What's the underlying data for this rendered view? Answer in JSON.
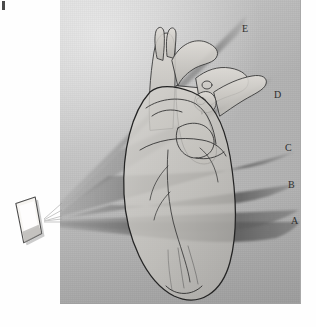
{
  "figure": {
    "panel": {
      "background_color": "#b9b9b9",
      "border_color": "#9a9a9a"
    },
    "page_background": "#fefefe",
    "corner_mark": {
      "name": "scan-edge-tick",
      "color": "#4a4a4a"
    }
  },
  "transducer": {
    "name": "ultrasound-transducer-probe",
    "body_color": "#f4f2ef",
    "outline_color": "#4d4d4d",
    "shadow_color": "#8b8b8b",
    "apex": {
      "x": 44,
      "y": 222
    }
  },
  "scan_planes": [
    {
      "id": "A",
      "label": "A",
      "label_x": 291,
      "label_y": 216,
      "tone": "#6f6f6f",
      "description": "lowest scan plane, through the ventricles"
    },
    {
      "id": "B",
      "label": "B",
      "label_x": 288,
      "label_y": 180,
      "tone": "#6a6a6a",
      "description": "scan plane through the mitral valve level"
    },
    {
      "id": "C",
      "label": "C",
      "label_x": 285,
      "label_y": 143,
      "tone": "#666666",
      "description": "scan plane through the aortic root"
    },
    {
      "id": "D",
      "label": "D",
      "label_x": 274,
      "label_y": 90,
      "tone": "#707070",
      "description": "scan plane angled superiorly through the great vessels"
    },
    {
      "id": "E",
      "label": "E",
      "label_x": 242,
      "label_y": 24,
      "tone": "#6e6e6e",
      "description": "highest scan plane, through the aortic arch"
    }
  ],
  "anatomy": {
    "name": "heart-illustration",
    "outline_color": "#2b2b2b",
    "fill_color": "#c6c4c0",
    "parts": [
      {
        "name": "heart-silhouette-outline"
      },
      {
        "name": "aorta"
      },
      {
        "name": "pulmonary-artery"
      },
      {
        "name": "superior-vena-cava"
      },
      {
        "name": "brachiocephalic-vessels"
      },
      {
        "name": "left-atrial-appendage"
      },
      {
        "name": "coronary-arteries"
      },
      {
        "name": "ventricular-apex"
      }
    ]
  },
  "bleed_through": [
    {
      "text": "and the",
      "x": 66,
      "y": 18
    },
    {
      "text": "imaging of",
      "x": 66,
      "y": 30
    },
    {
      "text": "the structures",
      "x": 150,
      "y": 30
    },
    {
      "text": "in the",
      "x": 66,
      "y": 58
    },
    {
      "text": "region of the",
      "x": 66,
      "y": 70
    },
    {
      "text": "heart and",
      "x": 150,
      "y": 58
    },
    {
      "text": "great vessels",
      "x": 150,
      "y": 70
    },
    {
      "text": "apex of the",
      "x": 28,
      "y": 268
    },
    {
      "text": "left",
      "x": 28,
      "y": 284
    },
    {
      "text": "ventricle is",
      "x": 64,
      "y": 284
    },
    {
      "text": "seen",
      "x": 132,
      "y": 284
    },
    {
      "text": "in",
      "x": 20,
      "y": 300
    },
    {
      "text": "all of the planes",
      "x": 40,
      "y": 312
    }
  ]
}
